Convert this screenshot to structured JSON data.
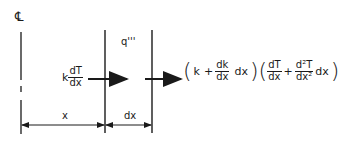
{
  "diagram": {
    "centerline_label": "℄",
    "left_flux": {
      "coef": "k",
      "num": "dT",
      "den": "dx"
    },
    "generation_label": "q'''",
    "dimension_x": "x",
    "dimension_dx": "dx",
    "right_flux": {
      "open1": "(",
      "k": "k",
      "plus1": "+",
      "dk_num": "dk",
      "dk_den": "dx",
      "dx1": "dx",
      "close1": ")",
      "open2": "(",
      "dT_num": "dT",
      "dT_den": "dx",
      "plus2": "+",
      "d2T_num": "d²T",
      "d2T_den": "dx²",
      "dx2": "dx",
      "close2": ")"
    },
    "colors": {
      "line": "#1a1a1a",
      "background": "#ffffff"
    }
  }
}
